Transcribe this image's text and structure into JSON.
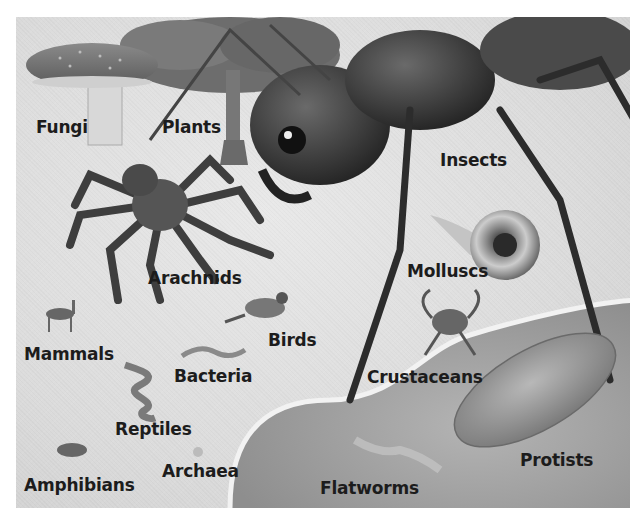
{
  "figure": {
    "title": "",
    "labels": [
      {
        "id": "fungi",
        "text": "Fungi",
        "x": 36,
        "y": 117
      },
      {
        "id": "plants",
        "text": "Plants",
        "x": 162,
        "y": 117
      },
      {
        "id": "insects",
        "text": "Insects",
        "x": 440,
        "y": 150
      },
      {
        "id": "arachnids",
        "text": "Arachnids",
        "x": 148,
        "y": 268
      },
      {
        "id": "molluscs",
        "text": "Molluscs",
        "x": 407,
        "y": 261
      },
      {
        "id": "birds",
        "text": "Birds",
        "x": 268,
        "y": 330
      },
      {
        "id": "mammals",
        "text": "Mammals",
        "x": 24,
        "y": 344
      },
      {
        "id": "bacteria",
        "text": "Bacteria",
        "x": 174,
        "y": 366
      },
      {
        "id": "crustaceans",
        "text": "Crustaceans",
        "x": 367,
        "y": 367
      },
      {
        "id": "reptiles",
        "text": "Reptiles",
        "x": 115,
        "y": 419
      },
      {
        "id": "archaea",
        "text": "Archaea",
        "x": 162,
        "y": 461
      },
      {
        "id": "amphibians",
        "text": "Amphibians",
        "x": 24,
        "y": 475
      },
      {
        "id": "protists",
        "text": "Protists",
        "x": 520,
        "y": 450
      },
      {
        "id": "flatworms",
        "text": "Flatworms",
        "x": 320,
        "y": 478
      }
    ]
  },
  "colors": {
    "background": "#dcdcdc",
    "label": "#1c1c1c",
    "water": "#a9a9a9",
    "dark_body": "#3a3a3a"
  }
}
